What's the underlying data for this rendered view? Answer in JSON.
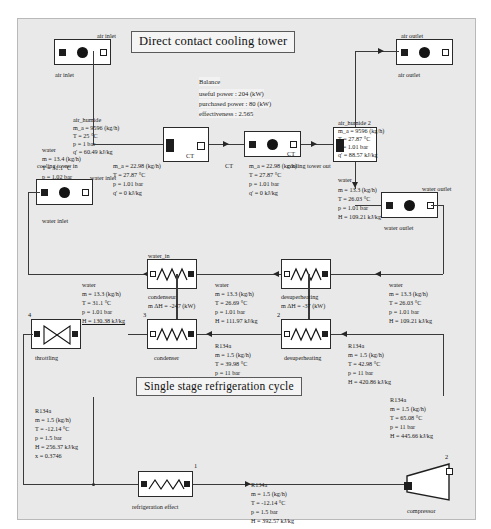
{
  "diagram": {
    "titles": {
      "top": "Direct contact cooling tower",
      "bottom": "Single stage refrigeration cycle"
    },
    "balance": {
      "heading": "Balance",
      "useful_power": "useful power : 204 (kW)",
      "purchased_power": "purchased power : 80 (kW)",
      "effectiveness": "effectiveness : 2.565"
    },
    "components": {
      "air_inlet_sensor": "air inlet",
      "air_inlet_tag": "air inlet",
      "air_outlet_sensor": "air outlet",
      "air_outlet_tag": "air outlet",
      "water_inlet_sensor": "water inlet",
      "water_inlet_tag": "water inlet",
      "water_inlet_tag2": "water inlet",
      "water_outlet_sensor": "water outlet",
      "water_outlet_tag": "water outlet",
      "cooling_tower_in": "cooling tower in",
      "cooling_tower_out": "cooling tower out",
      "ct_left": "CT",
      "ct_right": "CT",
      "ct_right_top": "CT",
      "condenser": "condenser",
      "condenseur": "condenseur",
      "water_in": "water_in",
      "desuperheating_hx": "desuperheating",
      "desuperheating_label": "desuperheating",
      "throttling": "throttling",
      "refrigeration_effect": "refrigeration effect",
      "compressor": "compressor"
    },
    "streams": {
      "air_humide_1": {
        "name": "air_humide",
        "lines": [
          "m_a = 9596 (kg/h)",
          "T = 25 °C",
          "p = 1 bar",
          "q' = 60.49 kJ/kg"
        ]
      },
      "air_humide_2": {
        "name": "air_humide 2",
        "lines": [
          "m_a = 9596 (kg/h)",
          "T = 27.87 °C",
          "p = 1.01 bar",
          "q' = 88.57 kJ/kg"
        ]
      },
      "water_inlet_top": {
        "name": "water",
        "lines": [
          "m = 13.4 (kg/h)",
          "T = 31.1 °C",
          "p = 1.02 bar",
          "H = 130.38 kJ/kg"
        ]
      },
      "ct_left_stream": {
        "name": "",
        "lines": [
          "m_a = 22.98 (kg/h)",
          "T = 27.87 °C",
          "p = 1.01 bar",
          "q' = 0 kJ/kg"
        ]
      },
      "ct_right_stream": {
        "name": "",
        "lines": [
          "m_a = 22.98 (kg/h)",
          "T = 27.87 °C",
          "p = 1.01 bar",
          "q' = 0 kJ/kg"
        ]
      },
      "water_outlet_top": {
        "name": "water",
        "lines": [
          "m = 13.3 (kg/h)",
          "T = 26.03 °C",
          "p = 1.01 bar",
          "H = 109.21 kJ/kg"
        ]
      },
      "water_left": {
        "name": "water",
        "lines": [
          "m = 13.3 (kg/h)",
          "T = 31.1 °C",
          "p = 1.01 bar",
          "H = 130.38 kJ/kg"
        ]
      },
      "water_mid": {
        "name": "water",
        "lines": [
          "m = 13.3 (kg/h)",
          "T = 26.69 °C",
          "p = 1.01 bar",
          "H = 111.97 kJ/kg"
        ]
      },
      "water_right": {
        "name": "water",
        "lines": [
          "m = 13.3 (kg/h)",
          "T = 26.03 °C",
          "p = 1.01 bar",
          "H = 109.21 kJ/kg"
        ]
      },
      "r134a_after_condenser": {
        "name": "R134a",
        "lines": [
          "m = 1.5 (kg/h)",
          "T = 39.98 °C",
          "p = 11 bar",
          "H = 256.37 kJ/kg"
        ]
      },
      "r134a_after_desup": {
        "name": "R134a",
        "lines": [
          "m = 1.5 (kg/h)",
          "T = 42.98 °C",
          "p = 11 bar",
          "H = 420.86 kJ/kg"
        ]
      },
      "r134a_after_throttle": {
        "name": "R134a",
        "lines": [
          "m = 1.5 (kg/h)",
          "T = -12.14 °C",
          "p = 1.5 bar",
          "H = 256.37 kJ/kg",
          "x = 0.3746"
        ]
      },
      "r134a_evap_out": {
        "name": "R134a",
        "lines": [
          "m = 1.5 (kg/h)",
          "T = -12.14 °C",
          "p = 1.5 bar",
          "H = 392.57 kJ/kg"
        ]
      },
      "r134a_compressor_out": {
        "name": "R134a",
        "lines": [
          "m = 1.5 (kg/h)",
          "T = 65.08 °C",
          "p = 11 bar",
          "H = 445.66 kJ/kg"
        ]
      }
    },
    "duties": {
      "condenser": "m ΔH = -247 (kW)",
      "desuperheating": "m ΔH = -37 (kW)"
    },
    "state_numbers": {
      "n1": "1",
      "n2": "2",
      "n3": "3",
      "n4": "4"
    }
  }
}
